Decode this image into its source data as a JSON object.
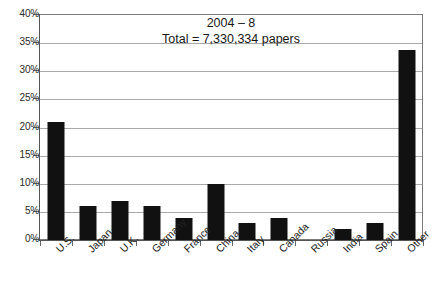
{
  "chart_data": {
    "type": "bar",
    "title": "2004 – 8",
    "subtitle": "Total = 7,330,334 papers",
    "xlabel": "",
    "ylabel": "",
    "ylim": [
      0,
      40
    ],
    "grid": true,
    "legend": false,
    "y_unit": "%",
    "categories": [
      "U.S.",
      "Japan",
      "U.K.",
      "Germany",
      "France",
      "China",
      "Italy",
      "Canada",
      "Russia",
      "India",
      "Spain",
      "Other"
    ],
    "values": [
      21,
      6,
      7,
      6,
      4,
      10,
      3,
      4,
      0,
      2,
      3,
      34
    ],
    "y_ticks": [
      0,
      5,
      10,
      15,
      20,
      25,
      30,
      35,
      40
    ],
    "y_tick_labels": [
      "0%",
      "5%",
      "10%",
      "15%",
      "20%",
      "25%",
      "30%",
      "35%",
      "40%"
    ],
    "bar_color": "#111111",
    "grid_color": "#a9a9a9",
    "axis_color": "#555555",
    "background": "#ffffff"
  }
}
